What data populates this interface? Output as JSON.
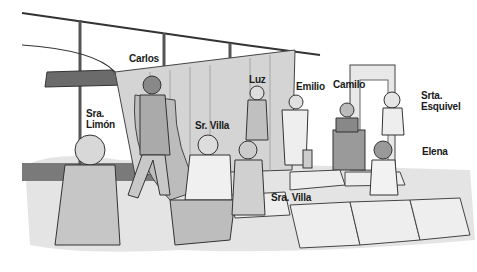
{
  "scene": {
    "description": "Airport waiting area illustration with labeled characters",
    "labels": [
      {
        "id": "carlos",
        "text": "Carlos"
      },
      {
        "id": "sra-limon",
        "text": "Sra.\nLimón"
      },
      {
        "id": "sr-villa",
        "text": "Sr. Villa"
      },
      {
        "id": "luz",
        "text": "Luz"
      },
      {
        "id": "emilio",
        "text": "Emilio"
      },
      {
        "id": "camilo",
        "text": "Camilo"
      },
      {
        "id": "srta-esquivel",
        "text": "Srta.\nEsquivel"
      },
      {
        "id": "elena",
        "text": "Elena"
      },
      {
        "id": "sra-villa",
        "text": "Sra. Villa"
      }
    ]
  }
}
